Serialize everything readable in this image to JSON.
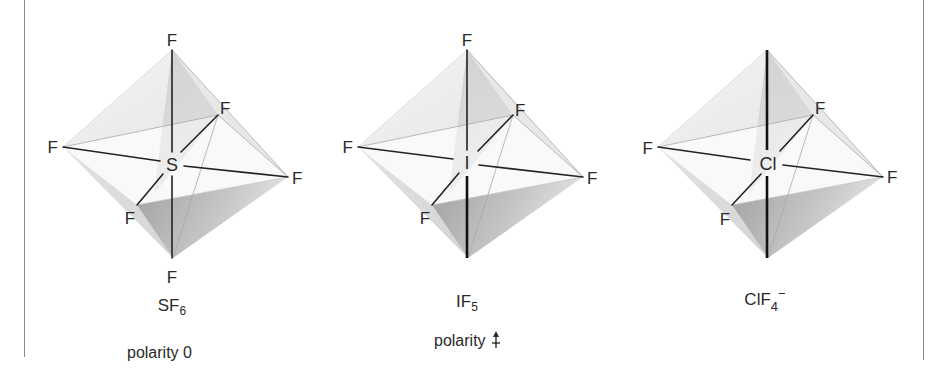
{
  "figure": {
    "molecules": [
      {
        "id": "sf6",
        "central_atom": "S",
        "ligands": [
          "F",
          "F",
          "F",
          "F",
          "F",
          "F"
        ],
        "formula": {
          "base": "SF",
          "subscript": "6",
          "charge": ""
        },
        "polarity": {
          "label": "polarity",
          "value": "0",
          "arrow": false
        },
        "lone_pair_axial": false
      },
      {
        "id": "if5",
        "central_atom": "I",
        "ligands": [
          "F",
          "F",
          "F",
          "F",
          "F"
        ],
        "formula": {
          "base": "IF",
          "subscript": "5",
          "charge": ""
        },
        "polarity": {
          "label": "polarity",
          "value": "",
          "arrow": true
        },
        "lone_pair_axial": true
      },
      {
        "id": "clf4-",
        "central_atom": "Cl",
        "ligands": [
          "F",
          "F",
          "F",
          "F"
        ],
        "formula": {
          "base": "ClF",
          "subscript": "4",
          "charge": "−"
        },
        "polarity": null,
        "lone_pair_axial": true
      }
    ],
    "colors": {
      "bond": "#222222",
      "face_light": "#ececec",
      "face_mid": "#d6d6d6",
      "face_dark": "#a4a4a4",
      "edge": "#9a9a9a",
      "frame": "#8a8a8a"
    }
  }
}
